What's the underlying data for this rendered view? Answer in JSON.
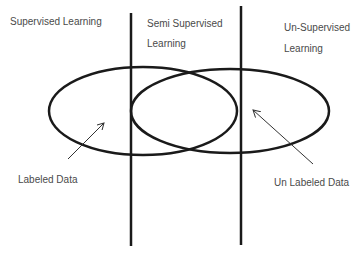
{
  "regions": {
    "supervised": "Supervised Learning",
    "semi_line1": "Semi Supervised",
    "semi_line2": "Learning",
    "unsupervised_line1": "Un-Supervised",
    "unsupervised_line2": "Learning"
  },
  "annotations": {
    "labeled": "Labeled Data",
    "unlabeled": "Un Labeled Data"
  },
  "colors": {
    "stroke": "#1a1a1a",
    "arrow": "#333333",
    "text": "#4a4a4a"
  }
}
